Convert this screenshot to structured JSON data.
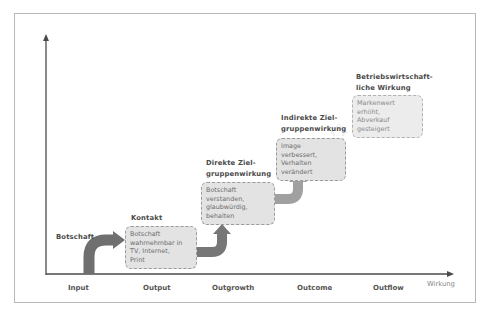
{
  "diagram": {
    "x_axis_name": "Wirkung",
    "x_axis_labels": [
      "Input",
      "Output",
      "Outgrowth",
      "Outcome",
      "Outflow"
    ],
    "stages": [
      {
        "title": "Botschaft",
        "description": ""
      },
      {
        "title": "Kontakt",
        "description": "Botschaft wahrnehmbar in TV, Internet, Print"
      },
      {
        "title": "Direkte Ziel-gruppenwirkung",
        "title_line1": "Direkte Ziel-",
        "title_line2": "gruppenwirkung",
        "description": "Botschaft verstanden, glaubwürdig, behalten"
      },
      {
        "title": "Indirekte Ziel-gruppenwirkung",
        "title_line1": "Indirekte Ziel-",
        "title_line2": "gruppenwirkung",
        "description": "Image verbessert, Verhalten verändert"
      },
      {
        "title": "Betriebswirtschaft-liche Wirkung",
        "title_line1": "Betriebswirtschaft-",
        "title_line2": "liche Wirkung",
        "description": "Markenwert erhöht, Abverkauf gesteigert"
      }
    ],
    "box_lines": {
      "kontakt": [
        "Botschaft",
        "wahrnehmbar in",
        "TV, Internet,",
        "Print"
      ],
      "direkt": [
        "Botschaft",
        "verstanden,",
        "glaubwürdig,",
        "behalten"
      ],
      "indirekt": [
        "Image",
        "verbessert,",
        "Verhalten",
        "verändert"
      ],
      "betrieb": [
        "Markenwert",
        "erhöht,",
        "Abverkauf",
        "gesteigert"
      ]
    },
    "colors": {
      "arrow_dark": "#6f6f6f",
      "arrow_mid": "#8a8a8a",
      "arrow_light": "#b5b5b5",
      "box_fill": "#e3e3e3",
      "axis": "#4a4a4a"
    }
  }
}
